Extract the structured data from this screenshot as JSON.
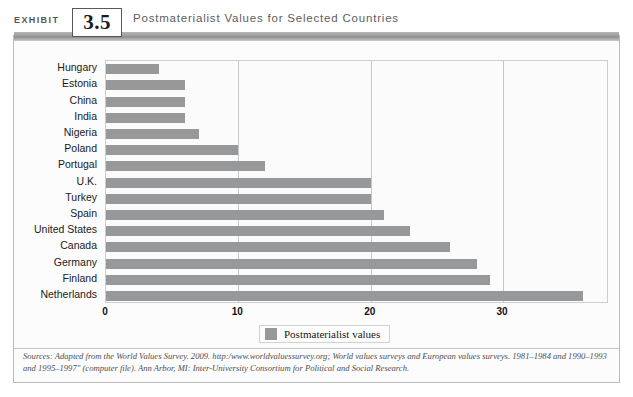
{
  "header": {
    "exhibit_word": "EXHIBIT",
    "exhibit_number": "3.5",
    "title": "Postmaterialist Values for Selected Countries"
  },
  "legend": {
    "label": "Postmaterialist values",
    "swatch_color": "#96989a"
  },
  "source": {
    "line1": "Sources: Adapted from the World Values Survey. 2009. http:/www.worldvaluessurvey.org; World values surveys and European values surveys.",
    "line2": "1981–1984 and 1990–1993 and 1995–1997\" (computer file). Ann Arbor, MI: Inter-University Consortium for Political and Social Research."
  },
  "chart_data": {
    "type": "bar",
    "orientation": "horizontal",
    "title": "Postmaterialist Values for Selected Countries",
    "xlabel": "",
    "ylabel": "",
    "xlim": [
      0,
      38
    ],
    "xticks": [
      0,
      10,
      20,
      30
    ],
    "xtick_labels": [
      "0",
      "10",
      "20",
      "30"
    ],
    "grid": true,
    "legend": [
      "Postmaterialist values"
    ],
    "legend_position": "bottom-center",
    "bar_color": "#96989a",
    "categories": [
      "Hungary",
      "Estonia",
      "China",
      "India",
      "Nigeria",
      "Poland",
      "Portugal",
      "U.K.",
      "Turkey",
      "Spain",
      "United States",
      "Canada",
      "Germany",
      "Finland",
      "Netherlands"
    ],
    "values": [
      4,
      6,
      6,
      6,
      7,
      10,
      12,
      20,
      20,
      21,
      23,
      26,
      28,
      29,
      36
    ]
  }
}
